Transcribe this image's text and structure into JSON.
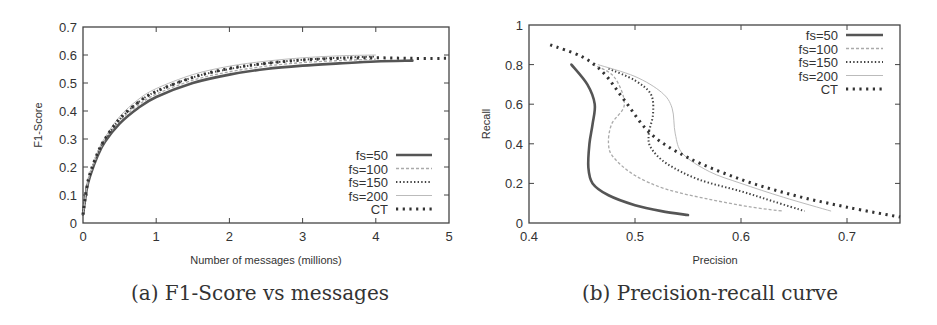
{
  "chart_data": [
    {
      "id": "a",
      "type": "line",
      "caption": "(a) F1-Score vs messages",
      "title": "",
      "xlabel": "Number of messages (millions)",
      "ylabel": "F1-Score",
      "xlim": [
        0,
        5
      ],
      "ylim": [
        0,
        0.7
      ],
      "xticks": [
        "0",
        "1",
        "2",
        "3",
        "4",
        "5"
      ],
      "yticks": [
        "0",
        "0.1",
        "0.2",
        "0.3",
        "0.4",
        "0.5",
        "0.6",
        "0.7"
      ],
      "grid": false,
      "legend_position": "lower right",
      "x": [
        0,
        0.05,
        0.1,
        0.2,
        0.3,
        0.5,
        0.75,
        1.0,
        1.5,
        2.0,
        2.5,
        3.0,
        3.5,
        4.0,
        4.5,
        5.0
      ],
      "series": [
        {
          "name": "fs=50",
          "style": "solid",
          "values": [
            0.03,
            0.12,
            0.17,
            0.24,
            0.29,
            0.355,
            0.41,
            0.45,
            0.5,
            0.53,
            0.55,
            0.562,
            0.57,
            0.577,
            0.58,
            null
          ]
        },
        {
          "name": "fs=100",
          "style": "dashed",
          "values": [
            0.03,
            0.12,
            0.175,
            0.245,
            0.295,
            0.365,
            0.42,
            0.46,
            0.51,
            0.54,
            0.56,
            0.573,
            0.58,
            0.585,
            null,
            null
          ]
        },
        {
          "name": "fs=150",
          "style": "dotted",
          "values": [
            0.03,
            0.125,
            0.178,
            0.25,
            0.3,
            0.37,
            0.43,
            0.47,
            0.52,
            0.55,
            0.57,
            0.583,
            0.59,
            0.595,
            null,
            null
          ]
        },
        {
          "name": "fs=200",
          "style": "dash-dot",
          "values": [
            0.03,
            0.125,
            0.18,
            0.255,
            0.305,
            0.38,
            0.44,
            0.48,
            0.53,
            0.56,
            0.578,
            0.59,
            0.597,
            0.6,
            null,
            null
          ]
        },
        {
          "name": "CT",
          "style": "heavy-dotted",
          "values": [
            0.03,
            0.125,
            0.18,
            0.25,
            0.3,
            0.372,
            0.43,
            0.47,
            0.52,
            0.552,
            0.57,
            0.582,
            0.588,
            0.59,
            0.588,
            0.588
          ]
        }
      ]
    },
    {
      "id": "b",
      "type": "line",
      "caption": "(b) Precision-recall curve",
      "title": "",
      "xlabel": "Precision",
      "ylabel": "Recall",
      "xlim": [
        0.4,
        0.75
      ],
      "ylim": [
        0,
        1
      ],
      "xticks": [
        "0.4",
        "0.5",
        "0.6",
        "0.7"
      ],
      "yticks": [
        "0",
        "0.2",
        "0.4",
        "0.6",
        "0.8",
        "1"
      ],
      "grid": false,
      "legend_position": "upper right",
      "series": [
        {
          "name": "fs=50",
          "style": "solid",
          "points": [
            [
              0.44,
              0.8
            ],
            [
              0.455,
              0.7
            ],
            [
              0.462,
              0.6
            ],
            [
              0.46,
              0.5
            ],
            [
              0.457,
              0.4
            ],
            [
              0.456,
              0.28
            ],
            [
              0.46,
              0.2
            ],
            [
              0.475,
              0.14
            ],
            [
              0.5,
              0.09
            ],
            [
              0.525,
              0.06
            ],
            [
              0.55,
              0.04
            ]
          ]
        },
        {
          "name": "fs=100",
          "style": "dashed",
          "points": [
            [
              0.46,
              0.8
            ],
            [
              0.48,
              0.74
            ],
            [
              0.49,
              0.6
            ],
            [
              0.478,
              0.5
            ],
            [
              0.475,
              0.4
            ],
            [
              0.48,
              0.33
            ],
            [
              0.5,
              0.24
            ],
            [
              0.53,
              0.17
            ],
            [
              0.57,
              0.12
            ],
            [
              0.61,
              0.08
            ],
            [
              0.64,
              0.06
            ]
          ]
        },
        {
          "name": "fs=150",
          "style": "dotted",
          "points": [
            [
              0.475,
              0.78
            ],
            [
              0.5,
              0.72
            ],
            [
              0.515,
              0.65
            ],
            [
              0.517,
              0.55
            ],
            [
              0.513,
              0.45
            ],
            [
              0.515,
              0.38
            ],
            [
              0.53,
              0.3
            ],
            [
              0.56,
              0.22
            ],
            [
              0.6,
              0.16
            ],
            [
              0.63,
              0.11
            ],
            [
              0.66,
              0.06
            ]
          ]
        },
        {
          "name": "fs=200",
          "style": "dash-dot",
          "points": [
            [
              0.465,
              0.8
            ],
            [
              0.5,
              0.74
            ],
            [
              0.525,
              0.66
            ],
            [
              0.535,
              0.58
            ],
            [
              0.538,
              0.45
            ],
            [
              0.545,
              0.35
            ],
            [
              0.57,
              0.26
            ],
            [
              0.6,
              0.2
            ],
            [
              0.64,
              0.13
            ],
            [
              0.685,
              0.06
            ]
          ]
        },
        {
          "name": "CT",
          "style": "heavy-dotted",
          "points": [
            [
              0.42,
              0.9
            ],
            [
              0.45,
              0.84
            ],
            [
              0.47,
              0.76
            ],
            [
              0.49,
              0.62
            ],
            [
              0.515,
              0.45
            ],
            [
              0.55,
              0.33
            ],
            [
              0.6,
              0.22
            ],
            [
              0.65,
              0.14
            ],
            [
              0.7,
              0.08
            ],
            [
              0.75,
              0.03
            ]
          ]
        }
      ]
    }
  ]
}
